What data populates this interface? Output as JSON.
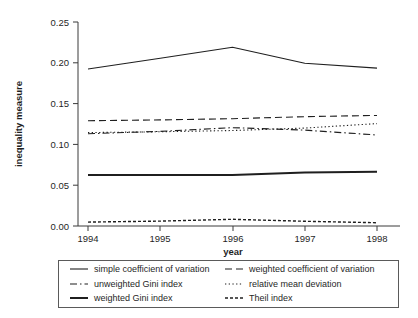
{
  "chart_data": {
    "type": "line",
    "title": "",
    "xlabel": "year",
    "ylabel": "inequality measure",
    "x": [
      1994,
      1995,
      1996,
      1997,
      1998
    ],
    "xticklabels": [
      "1994",
      "1995",
      "1996",
      "1997",
      "1998"
    ],
    "yticklabels": [
      "0.00",
      "0.05",
      "0.10",
      "0.15",
      "0.20",
      "0.25"
    ],
    "yticks": [
      0.0,
      0.05,
      0.1,
      0.15,
      0.2,
      0.25
    ],
    "ylim": [
      0.0,
      0.25
    ],
    "xlim": [
      1994,
      1998
    ],
    "grid": false,
    "legend_position": "below-axes",
    "series": [
      {
        "name": "simple coefficient of variation",
        "style": "solid",
        "width": 1.1,
        "values": [
          0.1925,
          0.2055,
          0.219,
          0.1995,
          0.1935
        ]
      },
      {
        "name": "weighted coefficient of variation",
        "style": "dashed",
        "width": 1.1,
        "values": [
          0.129,
          0.13,
          0.1315,
          0.134,
          0.1355
        ]
      },
      {
        "name": "unweighted Gini index",
        "style": "dashdot",
        "width": 1.1,
        "values": [
          0.113,
          0.116,
          0.1205,
          0.1175,
          0.1115
        ]
      },
      {
        "name": "relative mean deviation",
        "style": "dotted",
        "width": 1.1,
        "values": [
          0.1145,
          0.1155,
          0.117,
          0.12,
          0.1255
        ]
      },
      {
        "name": "weighted Gini index",
        "style": "solid",
        "width": 2.0,
        "values": [
          0.0625,
          0.0625,
          0.0625,
          0.0655,
          0.0665
        ]
      },
      {
        "name": "Theil index",
        "style": "shortdash",
        "width": 1.4,
        "values": [
          0.0048,
          0.006,
          0.0082,
          0.0058,
          0.004
        ]
      }
    ],
    "legend_entries": [
      {
        "label": "simple coefficient of variation",
        "style": "solid",
        "column": "left",
        "row": 0
      },
      {
        "label": "weighted coefficient of variation",
        "style": "dashed",
        "column": "right",
        "row": 0
      },
      {
        "label": "unweighted Gini index",
        "style": "dashdot",
        "column": "left",
        "row": 1
      },
      {
        "label": "relative mean deviation",
        "style": "dotted",
        "column": "right",
        "row": 1
      },
      {
        "label": "weighted Gini index",
        "style": "solid-thick",
        "column": "left",
        "row": 2
      },
      {
        "label": "Theil index",
        "style": "shortdash",
        "column": "right",
        "row": 2
      }
    ],
    "colors": {
      "line": "#1f1f1f",
      "axis": "#3a3a3a",
      "legend_border": "#5a5a5a",
      "background": "#ffffff"
    }
  }
}
